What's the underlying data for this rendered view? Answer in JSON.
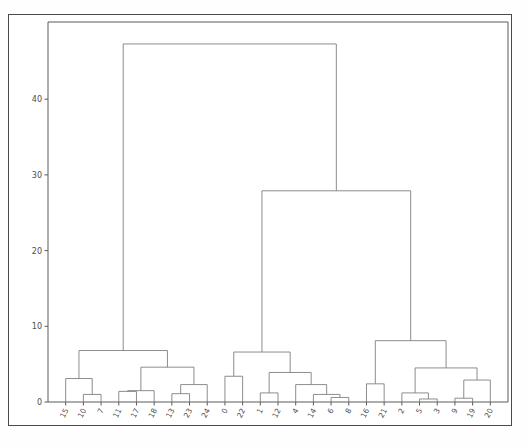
{
  "figure": {
    "type": "dendrogram",
    "background_color": "#ffffff",
    "border_color": "#4a4a4a",
    "line_color": "#808080"
  },
  "chart_data": {
    "type": "line",
    "subtype": "dendrogram",
    "title": "",
    "xlabel": "",
    "ylabel": "",
    "grid": false,
    "legend": false,
    "ylim": [
      0,
      49
    ],
    "yticks": [
      0,
      10,
      20,
      30,
      40
    ],
    "ytick_labels": [
      "0",
      "10",
      "20",
      "30",
      "40"
    ],
    "leaf_order": [
      "15",
      "10",
      "7",
      "11",
      "17",
      "18",
      "13",
      "23",
      "24",
      "0",
      "22",
      "1",
      "12",
      "4",
      "14",
      "6",
      "8",
      "16",
      "21",
      "2",
      "5",
      "3",
      "9",
      "19",
      "20"
    ],
    "leaf_count": 25,
    "links": [
      {
        "id": "L1",
        "left": {
          "leaf": "10"
        },
        "right": {
          "leaf": "7"
        },
        "height": 1.0
      },
      {
        "id": "L2",
        "left": {
          "leaf": "15"
        },
        "right": {
          "link": "L1"
        },
        "height": 3.1
      },
      {
        "id": "L3",
        "left": {
          "leaf": "11"
        },
        "right": {
          "leaf": "17"
        },
        "height": 1.4
      },
      {
        "id": "L4",
        "left": {
          "link": "L3"
        },
        "right": {
          "leaf": "18"
        },
        "height": 1.5
      },
      {
        "id": "L5",
        "left": {
          "leaf": "13"
        },
        "right": {
          "leaf": "23"
        },
        "height": 1.1
      },
      {
        "id": "L6",
        "left": {
          "link": "L5"
        },
        "right": {
          "leaf": "24"
        },
        "height": 2.3
      },
      {
        "id": "L7",
        "left": {
          "link": "L4"
        },
        "right": {
          "link": "L6"
        },
        "height": 4.6
      },
      {
        "id": "L8",
        "left": {
          "link": "L2"
        },
        "right": {
          "link": "L7"
        },
        "height": 6.8
      },
      {
        "id": "L9",
        "left": {
          "leaf": "1"
        },
        "right": {
          "leaf": "12"
        },
        "height": 1.2
      },
      {
        "id": "L10",
        "left": {
          "leaf": "0"
        },
        "right": {
          "leaf": "22"
        },
        "height": 3.4
      },
      {
        "id": "L11",
        "left": {
          "leaf": "6"
        },
        "right": {
          "leaf": "8"
        },
        "height": 0.6
      },
      {
        "id": "L12",
        "left": {
          "leaf": "14"
        },
        "right": {
          "link": "L11"
        },
        "height": 1.0
      },
      {
        "id": "L13",
        "left": {
          "leaf": "4"
        },
        "right": {
          "link": "L12"
        },
        "height": 2.3
      },
      {
        "id": "L14",
        "left": {
          "link": "L9"
        },
        "right": {
          "link": "L13"
        },
        "height": 3.9
      },
      {
        "id": "L15",
        "left": {
          "link": "L10"
        },
        "right": {
          "link": "L14"
        },
        "height": 6.6
      },
      {
        "id": "L16",
        "left": {
          "leaf": "5"
        },
        "right": {
          "leaf": "3"
        },
        "height": 0.4
      },
      {
        "id": "L17",
        "left": {
          "leaf": "2"
        },
        "right": {
          "link": "L16"
        },
        "height": 1.2
      },
      {
        "id": "L18",
        "left": {
          "leaf": "9"
        },
        "right": {
          "leaf": "19"
        },
        "height": 0.5
      },
      {
        "id": "L19",
        "left": {
          "link": "L18"
        },
        "right": {
          "leaf": "20"
        },
        "height": 2.9
      },
      {
        "id": "L20",
        "left": {
          "link": "L17"
        },
        "right": {
          "link": "L19"
        },
        "height": 4.5
      },
      {
        "id": "L21",
        "left": {
          "leaf": "16"
        },
        "right": {
          "leaf": "21"
        },
        "height": 2.4
      },
      {
        "id": "L22",
        "left": {
          "link": "L21"
        },
        "right": {
          "link": "L20"
        },
        "height": 8.1
      },
      {
        "id": "L23",
        "left": {
          "link": "L15"
        },
        "right": {
          "link": "L22"
        },
        "height": 27.9
      },
      {
        "id": "L24",
        "left": {
          "link": "L8"
        },
        "right": {
          "link": "L23"
        },
        "height": 47.3
      }
    ]
  }
}
